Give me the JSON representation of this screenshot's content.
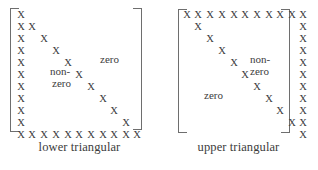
{
  "figure": {
    "glyph": "X",
    "rows": 11,
    "cols": 11,
    "ink_color": "#3c3c3c",
    "bracket_color": "#6e6e6e",
    "background": "#ffffff"
  },
  "panels": [
    {
      "id": "lower-triangular",
      "caption": "lower triangular",
      "labels": [
        {
          "text": "non-",
          "x": 34,
          "y": 57
        },
        {
          "text": "zero",
          "x": 36,
          "y": 69
        },
        {
          "text": "zero",
          "x": 84,
          "y": 45
        }
      ],
      "cells": [
        {
          "row": 0,
          "col": 0
        },
        {
          "row": 1,
          "col": 0
        },
        {
          "row": 1,
          "col": 1
        },
        {
          "row": 2,
          "col": 0
        },
        {
          "row": 2,
          "col": 2
        },
        {
          "row": 3,
          "col": 0
        },
        {
          "row": 3,
          "col": 3
        },
        {
          "row": 4,
          "col": 0
        },
        {
          "row": 4,
          "col": 4
        },
        {
          "row": 5,
          "col": 0
        },
        {
          "row": 5,
          "col": 5
        },
        {
          "row": 6,
          "col": 0
        },
        {
          "row": 6,
          "col": 6
        },
        {
          "row": 7,
          "col": 0
        },
        {
          "row": 7,
          "col": 7
        },
        {
          "row": 8,
          "col": 0
        },
        {
          "row": 8,
          "col": 8
        },
        {
          "row": 9,
          "col": 0
        },
        {
          "row": 9,
          "col": 9
        },
        {
          "row": 10,
          "col": 0
        },
        {
          "row": 10,
          "col": 1
        },
        {
          "row": 10,
          "col": 2
        },
        {
          "row": 10,
          "col": 3
        },
        {
          "row": 10,
          "col": 4
        },
        {
          "row": 10,
          "col": 5
        },
        {
          "row": 10,
          "col": 6
        },
        {
          "row": 10,
          "col": 7
        },
        {
          "row": 10,
          "col": 8
        },
        {
          "row": 10,
          "col": 9
        },
        {
          "row": 10,
          "col": 10
        }
      ]
    },
    {
      "id": "upper-triangular",
      "caption": "upper triangular",
      "labels": [
        {
          "text": "non-",
          "x": 68,
          "y": 45
        },
        {
          "text": "zero",
          "x": 68,
          "y": 57
        },
        {
          "text": "zero",
          "x": 22,
          "y": 81
        }
      ],
      "cells": [
        {
          "row": 0,
          "col": 0
        },
        {
          "row": 0,
          "col": 1
        },
        {
          "row": 0,
          "col": 2
        },
        {
          "row": 0,
          "col": 3
        },
        {
          "row": 0,
          "col": 4
        },
        {
          "row": 0,
          "col": 5
        },
        {
          "row": 0,
          "col": 6
        },
        {
          "row": 0,
          "col": 7
        },
        {
          "row": 0,
          "col": 8
        },
        {
          "row": 0,
          "col": 9
        },
        {
          "row": 0,
          "col": 10
        },
        {
          "row": 1,
          "col": 1
        },
        {
          "row": 1,
          "col": 10
        },
        {
          "row": 2,
          "col": 2
        },
        {
          "row": 2,
          "col": 10
        },
        {
          "row": 3,
          "col": 3
        },
        {
          "row": 3,
          "col": 10
        },
        {
          "row": 4,
          "col": 4
        },
        {
          "row": 4,
          "col": 10
        },
        {
          "row": 5,
          "col": 5
        },
        {
          "row": 5,
          "col": 10
        },
        {
          "row": 6,
          "col": 6
        },
        {
          "row": 6,
          "col": 10
        },
        {
          "row": 7,
          "col": 7
        },
        {
          "row": 7,
          "col": 10
        },
        {
          "row": 8,
          "col": 8
        },
        {
          "row": 8,
          "col": 10
        },
        {
          "row": 9,
          "col": 9
        },
        {
          "row": 9,
          "col": 10
        },
        {
          "row": 10,
          "col": 10
        }
      ]
    }
  ]
}
